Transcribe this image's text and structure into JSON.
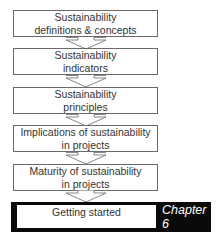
{
  "diagram": {
    "steps": [
      {
        "line1": "Sustainability",
        "line2": "definitions & concepts"
      },
      {
        "line1": "Sustainability",
        "line2": "indicators"
      },
      {
        "line1": "Sustainability",
        "line2": "principles"
      },
      {
        "line1": "Implications of sustainability",
        "line2": "in projects"
      },
      {
        "line1": "Maturity of sustainability",
        "line2": "in projects"
      }
    ],
    "final_step": {
      "label": "Getting started",
      "chapter_line1": "Chapter",
      "chapter_line2": "6"
    },
    "colors": {
      "border": "#6a6a6a",
      "highlight_bar": "#0a0a0a",
      "text": "#333333"
    }
  }
}
